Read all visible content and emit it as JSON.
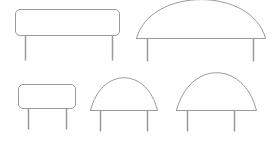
{
  "canvas": {
    "width": 274,
    "height": 141,
    "background_color": "#ffffff",
    "title": "Signboard outline sketches",
    "description": "Line drawing of five blank signboards on posts, arranged in two rows"
  },
  "style": {
    "outline_color": "#8e8e8e",
    "post_color": "#9a9a9a",
    "fill_color": "#ffffff",
    "outline_width": 0.9,
    "post_width": 1.5
  },
  "signs": [
    {
      "id": "sign-top-left",
      "name": "rounded-rectangle-signboard-large",
      "shape": "rounded-rectangle",
      "row": "top",
      "board": {
        "x": 15.5,
        "y": 9.5,
        "width": 104,
        "height": 26,
        "radius": 4.5
      },
      "posts": [
        {
          "x": 25.5,
          "y_top": 35.5,
          "y_bottom": 60.5
        },
        {
          "x": 112.5,
          "y_top": 35.5,
          "y_bottom": 60.5
        }
      ],
      "label": ""
    },
    {
      "id": "sign-top-right",
      "name": "arched-signboard-wide",
      "shape": "arch",
      "row": "top",
      "board": {
        "x_left": 136.5,
        "x_right": 265.5,
        "y_base": 38.5,
        "y_peak": 9.5,
        "flatness": 0.62
      },
      "posts": [
        {
          "x": 147.5,
          "y_top": 38.5,
          "y_bottom": 61.5
        },
        {
          "x": 253.5,
          "y_top": 38.5,
          "y_bottom": 61.5
        }
      ],
      "label": ""
    },
    {
      "id": "sign-bottom-left",
      "name": "rounded-rectangle-signboard-small",
      "shape": "rounded-rectangle",
      "row": "bottom",
      "board": {
        "x": 18.5,
        "y": 84.5,
        "width": 57,
        "height": 24,
        "radius": 4.5
      },
      "posts": [
        {
          "x": 28.5,
          "y_top": 108.5,
          "y_bottom": 129.5
        },
        {
          "x": 66.5,
          "y_top": 108.5,
          "y_bottom": 129.5
        }
      ],
      "label": ""
    },
    {
      "id": "sign-bottom-middle",
      "name": "arched-signboard-medium",
      "shape": "arch",
      "row": "bottom",
      "board": {
        "x_left": 90.5,
        "x_right": 157.5,
        "y_base": 110.5,
        "y_peak": 84.5,
        "flatness": 0.42
      },
      "posts": [
        {
          "x": 100.5,
          "y_top": 110.5,
          "y_bottom": 131.5
        },
        {
          "x": 147.5,
          "y_top": 110.5,
          "y_bottom": 131.5
        }
      ],
      "label": ""
    },
    {
      "id": "sign-bottom-right",
      "name": "arched-signboard-large",
      "shape": "arch",
      "row": "bottom",
      "board": {
        "x_left": 176.5,
        "x_right": 256.5,
        "y_base": 110.5,
        "y_peak": 80.5,
        "flatness": 0.42
      },
      "posts": [
        {
          "x": 187.5,
          "y_top": 110.5,
          "y_bottom": 131.5
        },
        {
          "x": 234.5,
          "y_top": 110.5,
          "y_bottom": 131.5
        }
      ],
      "label": ""
    }
  ]
}
